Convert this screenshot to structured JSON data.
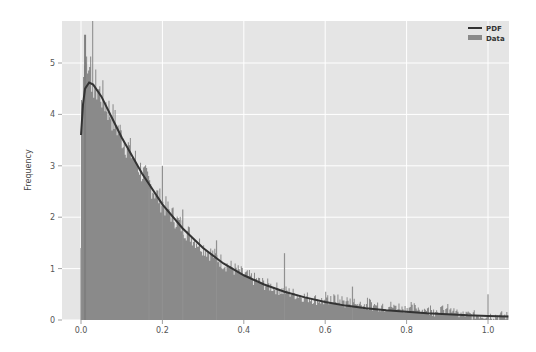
{
  "chart_data": {
    "type": "bar",
    "title": "",
    "xlabel": "",
    "ylabel": "Frequency",
    "xlim": [
      -0.045,
      1.05
    ],
    "ylim": [
      0,
      5.85
    ],
    "xticks": [
      0.0,
      0.2,
      0.4,
      0.6,
      0.8,
      1.0
    ],
    "xtick_labels": [
      "0.0",
      "0.2",
      "0.4",
      "0.6",
      "0.8",
      "1.0"
    ],
    "yticks": [
      0,
      1,
      2,
      3,
      4,
      5
    ],
    "ytick_labels": [
      "0",
      "1",
      "2",
      "3",
      "4",
      "5"
    ],
    "grid": true,
    "legend_position": "upper right",
    "legend": [
      {
        "label": "PDF",
        "type": "line",
        "color": "#333333"
      },
      {
        "label": "Data",
        "type": "patch",
        "color": "#8a8a8a"
      }
    ],
    "series": [
      {
        "name": "PDF",
        "type": "line",
        "x": [
          0.0,
          0.005,
          0.01,
          0.02,
          0.03,
          0.05,
          0.075,
          0.1,
          0.15,
          0.2,
          0.25,
          0.3,
          0.35,
          0.4,
          0.45,
          0.5,
          0.55,
          0.6,
          0.65,
          0.7,
          0.75,
          0.8,
          0.85,
          0.9,
          0.95,
          1.0,
          1.05
        ],
        "values": [
          3.6,
          4.2,
          4.5,
          4.62,
          4.58,
          4.35,
          3.95,
          3.55,
          2.85,
          2.25,
          1.78,
          1.4,
          1.1,
          0.87,
          0.69,
          0.55,
          0.44,
          0.35,
          0.28,
          0.23,
          0.19,
          0.16,
          0.13,
          0.11,
          0.09,
          0.08,
          0.07
        ]
      },
      {
        "name": "Data",
        "type": "histogram",
        "x_range": [
          0.0,
          1.05
        ],
        "peak_value": 5.55,
        "peak_x": 0.01,
        "notable_spikes": [
          {
            "x": 0.0,
            "value": 1.4
          },
          {
            "x": 0.167,
            "value": 2.55
          },
          {
            "x": 0.2,
            "value": 3.0
          },
          {
            "x": 0.25,
            "value": 2.15
          },
          {
            "x": 0.333,
            "value": 1.55
          },
          {
            "x": 0.5,
            "value": 1.3
          },
          {
            "x": 0.667,
            "value": 0.65
          },
          {
            "x": 1.0,
            "value": 0.5
          }
        ]
      }
    ],
    "colors": {
      "background": "#e5e5e5",
      "grid": "#ffffff",
      "bars": "#8a8a8a",
      "pdf_line": "#333333"
    }
  }
}
